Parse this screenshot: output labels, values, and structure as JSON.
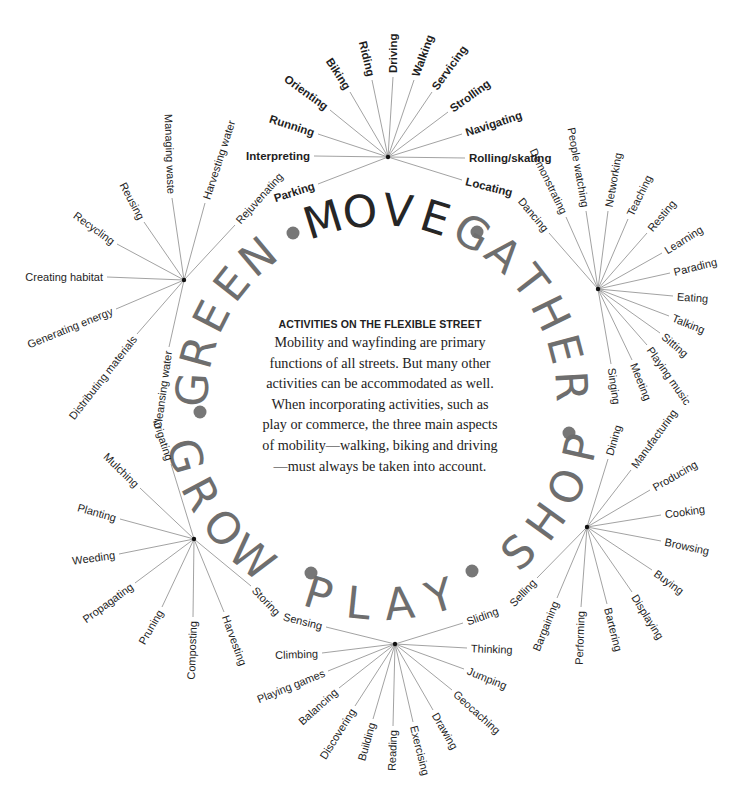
{
  "title": "ACTIVITIES ON THE FLEXIBLE STREET",
  "body": "Mobility and wayfinding are primary functions of all streets. But many other activities can be accommodated as well. When incorporating activities, such as play or commerce, the three main aspects of mobility—walking, biking and driving—must always be taken into account.",
  "colors": {
    "move": "#262626",
    "category": "#6e6e6e",
    "dot": "#777777",
    "spoke": "#8a8a8a",
    "label": "#1e1e1e"
  },
  "ring": {
    "center": [
      382,
      400
    ],
    "radius": 190,
    "words": [
      {
        "text": "MOVE",
        "angle": 0,
        "dark": true
      },
      {
        "text": "GATHER",
        "angle": 58,
        "dark": false
      },
      {
        "text": "SHOP",
        "angle": 120,
        "dark": false
      },
      {
        "text": "PLAY",
        "angle": 180,
        "dark": false
      },
      {
        "text": "GROW",
        "angle": 236,
        "dark": false
      },
      {
        "text": "GREEN",
        "angle": 297,
        "dark": false
      }
    ],
    "dots": [
      [
        293,
        233
      ],
      [
        477,
        232
      ],
      [
        569,
        433
      ],
      [
        472,
        571
      ],
      [
        311,
        573
      ],
      [
        200,
        412
      ]
    ]
  },
  "categories": [
    {
      "name": "MOVE",
      "hub": [
        388,
        157
      ],
      "bold": true,
      "items": [
        {
          "label": "Parking",
          "x": 318,
          "y": 184,
          "r": -18,
          "a": "end"
        },
        {
          "label": "Interpreting",
          "x": 314,
          "y": 156,
          "r": 0,
          "a": "end"
        },
        {
          "label": "Running",
          "x": 318,
          "y": 134,
          "r": 18,
          "a": "end"
        },
        {
          "label": "Orienting",
          "x": 330,
          "y": 110,
          "r": 36,
          "a": "end"
        },
        {
          "label": "Biking",
          "x": 350,
          "y": 92,
          "r": 57,
          "a": "end"
        },
        {
          "label": "Riding",
          "x": 372,
          "y": 80,
          "r": 76,
          "a": "end"
        },
        {
          "label": "Driving",
          "x": 393,
          "y": 77,
          "r": -90,
          "a": "start"
        },
        {
          "label": "Walking",
          "x": 414,
          "y": 80,
          "r": -70,
          "a": "start"
        },
        {
          "label": "Servicing",
          "x": 432,
          "y": 92,
          "r": -54,
          "a": "start"
        },
        {
          "label": "Strolling",
          "x": 448,
          "y": 112,
          "r": -36,
          "a": "start"
        },
        {
          "label": "Navigating",
          "x": 462,
          "y": 134,
          "r": -18,
          "a": "start"
        },
        {
          "label": "Rolling/skating",
          "x": 465,
          "y": 158,
          "r": 0,
          "a": "start"
        },
        {
          "label": "Locating",
          "x": 462,
          "y": 180,
          "r": 14,
          "a": "start"
        }
      ]
    },
    {
      "name": "GATHER",
      "hub": [
        598,
        289
      ],
      "bold": false,
      "items": [
        {
          "label": "Dancing",
          "x": 549,
          "y": 233,
          "r": 50,
          "a": "end"
        },
        {
          "label": "Demonstrating",
          "x": 566,
          "y": 217,
          "r": 64,
          "a": "end"
        },
        {
          "label": "People watching",
          "x": 586,
          "y": 211,
          "r": 80,
          "a": "end"
        },
        {
          "label": "Networking",
          "x": 608,
          "y": 211,
          "r": -80,
          "a": "start"
        },
        {
          "label": "Teaching",
          "x": 628,
          "y": 219,
          "r": -64,
          "a": "start"
        },
        {
          "label": "Resting",
          "x": 647,
          "y": 233,
          "r": -50,
          "a": "start"
        },
        {
          "label": "Learning",
          "x": 662,
          "y": 253,
          "r": -32,
          "a": "start"
        },
        {
          "label": "Parading",
          "x": 670,
          "y": 273,
          "r": -14,
          "a": "start"
        },
        {
          "label": "Eating",
          "x": 673,
          "y": 296,
          "r": 4,
          "a": "start"
        },
        {
          "label": "Talking",
          "x": 669,
          "y": 316,
          "r": 22,
          "a": "start"
        },
        {
          "label": "Sitting",
          "x": 660,
          "y": 333,
          "r": 40,
          "a": "start"
        },
        {
          "label": "Playing music",
          "x": 647,
          "y": 345,
          "r": 55,
          "a": "start"
        },
        {
          "label": "Meeting",
          "x": 632,
          "y": 360,
          "r": 68,
          "a": "start"
        },
        {
          "label": "Singing",
          "x": 611,
          "y": 364,
          "r": 82,
          "a": "start"
        }
      ]
    },
    {
      "name": "SHOP",
      "hub": [
        587,
        527
      ],
      "bold": false,
      "items": [
        {
          "label": "Dining",
          "x": 608,
          "y": 459,
          "r": -74,
          "a": "start"
        },
        {
          "label": "Manufacturing",
          "x": 631,
          "y": 470,
          "r": -54,
          "a": "start"
        },
        {
          "label": "Producing",
          "x": 650,
          "y": 490,
          "r": -30,
          "a": "start"
        },
        {
          "label": "Cooking",
          "x": 661,
          "y": 515,
          "r": -8,
          "a": "start"
        },
        {
          "label": "Browsing",
          "x": 661,
          "y": 541,
          "r": 12,
          "a": "start"
        },
        {
          "label": "Buying",
          "x": 652,
          "y": 570,
          "r": 36,
          "a": "start"
        },
        {
          "label": "Displaying",
          "x": 632,
          "y": 592,
          "r": 58,
          "a": "start"
        },
        {
          "label": "Bartering",
          "x": 607,
          "y": 604,
          "r": 76,
          "a": "start"
        },
        {
          "label": "Performing",
          "x": 581,
          "y": 607,
          "r": -88,
          "a": "end"
        },
        {
          "label": "Bargaining",
          "x": 557,
          "y": 598,
          "r": -68,
          "a": "end"
        },
        {
          "label": "Selling",
          "x": 537,
          "y": 578,
          "r": -46,
          "a": "end"
        }
      ]
    },
    {
      "name": "PLAY",
      "hub": [
        395,
        644
      ],
      "bold": false,
      "items": [
        {
          "label": "Sensing",
          "x": 326,
          "y": 627,
          "r": 14,
          "a": "end"
        },
        {
          "label": "Climbing",
          "x": 322,
          "y": 653,
          "r": -2,
          "a": "end"
        },
        {
          "label": "Playing games",
          "x": 328,
          "y": 671,
          "r": -22,
          "a": "end"
        },
        {
          "label": "Balancing",
          "x": 339,
          "y": 688,
          "r": -42,
          "a": "end"
        },
        {
          "label": "Discovering",
          "x": 355,
          "y": 706,
          "r": -58,
          "a": "end"
        },
        {
          "label": "Building",
          "x": 373,
          "y": 719,
          "r": -74,
          "a": "end"
        },
        {
          "label": "Reading",
          "x": 393,
          "y": 726,
          "r": -88,
          "a": "end"
        },
        {
          "label": "Exercising",
          "x": 413,
          "y": 722,
          "r": 76,
          "a": "start"
        },
        {
          "label": "Drawing",
          "x": 433,
          "y": 710,
          "r": 60,
          "a": "start"
        },
        {
          "label": "Geocaching",
          "x": 452,
          "y": 690,
          "r": 42,
          "a": "start"
        },
        {
          "label": "Jumping",
          "x": 464,
          "y": 669,
          "r": 22,
          "a": "start"
        },
        {
          "label": "Thinking",
          "x": 467,
          "y": 648,
          "r": 2,
          "a": "start"
        },
        {
          "label": "Sliding",
          "x": 463,
          "y": 623,
          "r": -20,
          "a": "start"
        }
      ]
    },
    {
      "name": "GROW",
      "hub": [
        194,
        539
      ],
      "bold": false,
      "items": [
        {
          "label": "Irrigating",
          "x": 171,
          "y": 464,
          "r": 72,
          "a": "end"
        },
        {
          "label": "Mulching",
          "x": 140,
          "y": 488,
          "r": 44,
          "a": "end"
        },
        {
          "label": "Planting",
          "x": 120,
          "y": 519,
          "r": 16,
          "a": "end"
        },
        {
          "label": "Weeding",
          "x": 119,
          "y": 554,
          "r": -8,
          "a": "end"
        },
        {
          "label": "Propagating",
          "x": 135,
          "y": 583,
          "r": -36,
          "a": "end"
        },
        {
          "label": "Pruning",
          "x": 162,
          "y": 607,
          "r": -60,
          "a": "end"
        },
        {
          "label": "Composting",
          "x": 193,
          "y": 617,
          "r": -88,
          "a": "end"
        },
        {
          "label": "Harvesting",
          "x": 224,
          "y": 612,
          "r": 70,
          "a": "start"
        },
        {
          "label": "Storing",
          "x": 251,
          "y": 586,
          "r": 46,
          "a": "start"
        }
      ]
    },
    {
      "name": "GREEN",
      "hub": [
        184,
        280
      ],
      "bold": false,
      "items": [
        {
          "label": "Rejuvenating",
          "x": 235,
          "y": 225,
          "r": -48,
          "a": "start"
        },
        {
          "label": "Harvesting water",
          "x": 205,
          "y": 203,
          "r": -72,
          "a": "start"
        },
        {
          "label": "Managing waste",
          "x": 172,
          "y": 198,
          "r": 88,
          "a": "end"
        },
        {
          "label": "Reusing",
          "x": 144,
          "y": 222,
          "r": 62,
          "a": "end"
        },
        {
          "label": "Recycling",
          "x": 117,
          "y": 244,
          "r": 36,
          "a": "end"
        },
        {
          "label": "Creating habitat",
          "x": 107,
          "y": 277,
          "r": 0,
          "a": "end"
        },
        {
          "label": "Generating energy",
          "x": 116,
          "y": 309,
          "r": -22,
          "a": "end"
        },
        {
          "label": "Distributing materials",
          "x": 137,
          "y": 334,
          "r": -52,
          "a": "end"
        },
        {
          "label": "Cleansing water",
          "x": 169,
          "y": 347,
          "r": -82,
          "a": "end"
        }
      ]
    }
  ]
}
